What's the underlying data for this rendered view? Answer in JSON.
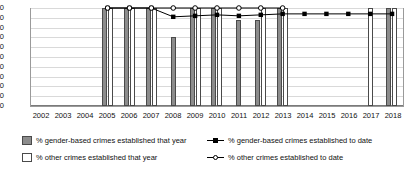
{
  "chart_data": {
    "type": "bar",
    "title": "",
    "subtitle": "",
    "xlabel": "",
    "ylabel": "",
    "ylim": [
      0,
      100
    ],
    "ytick_step": 10,
    "grid": true,
    "legend_position": "bottom",
    "categories": [
      "2002",
      "2003",
      "2004",
      "2005",
      "2006",
      "2007",
      "2008",
      "2009",
      "2010",
      "2011",
      "2012",
      "2013",
      "2014",
      "2015",
      "2016",
      "2017",
      "2018"
    ],
    "yticks": [
      "100",
      "90",
      "80",
      "70",
      "60",
      "50",
      "40",
      "30",
      "20",
      "10",
      "0"
    ],
    "series": [
      {
        "name": "% gender-based crimes established that year",
        "kind": "bar",
        "color": "#8c8c8c",
        "values": [
          null,
          null,
          null,
          100,
          100,
          100,
          70,
          100,
          100,
          88,
          88,
          100,
          null,
          null,
          null,
          null,
          100
        ]
      },
      {
        "name": "% other crimes established that year",
        "kind": "bar",
        "color": "#ffffff",
        "values": [
          null,
          null,
          null,
          100,
          100,
          100,
          null,
          100,
          100,
          null,
          100,
          100,
          null,
          null,
          null,
          100,
          100
        ]
      },
      {
        "name": "% gender-based crimes established to date",
        "kind": "line",
        "marker": "filled-square",
        "color": "#000000",
        "values": [
          null,
          null,
          null,
          100,
          100,
          100,
          91,
          92,
          93,
          92,
          93,
          94,
          94,
          94,
          94,
          94,
          94
        ]
      },
      {
        "name": "% other crimes established to date",
        "kind": "line",
        "marker": "hollow-circle",
        "color": "#000000",
        "values": [
          null,
          null,
          null,
          100,
          100,
          100,
          100,
          100,
          100,
          100,
          100,
          100,
          null,
          null,
          null,
          null,
          null
        ]
      }
    ]
  },
  "legend": {
    "items": [
      {
        "label": "% gender-based crimes established that year",
        "key": "swatch-gender"
      },
      {
        "label": "% other crimes established that year",
        "key": "swatch-other"
      },
      {
        "label": "% gender-based crimes established to date",
        "key": "line-gender"
      },
      {
        "label": "% other crimes established to date",
        "key": "line-other"
      }
    ]
  }
}
